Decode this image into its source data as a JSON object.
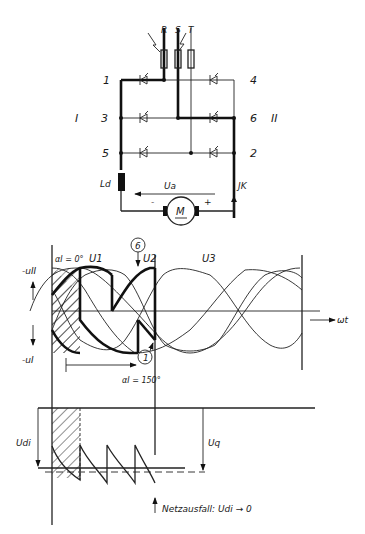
{
  "circuit": {
    "phases": [
      "R",
      "S",
      "T"
    ],
    "thyristor_numbers": [
      "1",
      "3",
      "5",
      "4",
      "6",
      "2"
    ],
    "group_labels": [
      "I",
      "II"
    ],
    "inductor_label": "Ld",
    "current_label": "JK",
    "voltage_label": "Ua",
    "motor_label": "M",
    "polarity_minus": "-",
    "polarity_plus": "+"
  },
  "waveform": {
    "y_label_top": "-uII",
    "y_label_bottom": "-uI",
    "x_label": "ωt",
    "phase_labels": [
      "U1",
      "U2",
      "U3"
    ],
    "alpha_start": "αI = 0°",
    "alpha_end": "αI = 150°",
    "marker_6": "6",
    "marker_1": "1"
  },
  "dc_plot": {
    "udi_label": "Udi",
    "uq_label": "Uq"
  },
  "footer": {
    "caption": "Netzausfall: Udi → 0"
  }
}
